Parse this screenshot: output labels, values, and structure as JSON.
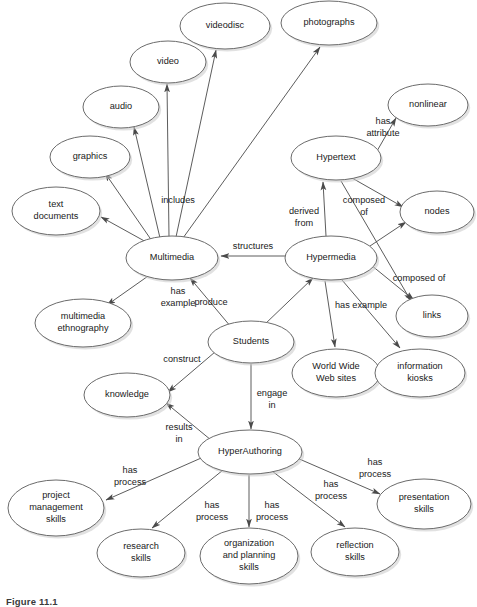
{
  "figure": {
    "caption": "Figure 11.1",
    "width": 477,
    "height": 605,
    "background_color": "#ffffff",
    "node_stroke_color": "#6b6b6b",
    "edge_color": "#4a4a4a",
    "text_color": "#1a1a1a"
  },
  "diagram": {
    "type": "concept-map",
    "nodes": [
      {
        "id": "videodisc",
        "label": "videodisc",
        "lines": [
          "videodisc"
        ],
        "cx": 225,
        "cy": 26,
        "rx": 45,
        "ry": 23
      },
      {
        "id": "photographs",
        "label": "photographs",
        "lines": [
          "photographs"
        ],
        "cx": 329,
        "cy": 23,
        "rx": 48,
        "ry": 22
      },
      {
        "id": "video",
        "label": "video",
        "lines": [
          "video"
        ],
        "cx": 168,
        "cy": 62,
        "rx": 38,
        "ry": 21
      },
      {
        "id": "audio",
        "label": "audio",
        "lines": [
          "audio"
        ],
        "cx": 121,
        "cy": 107,
        "rx": 38,
        "ry": 21
      },
      {
        "id": "nonlinear",
        "label": "nonlinear",
        "lines": [
          "nonlinear"
        ],
        "cx": 428,
        "cy": 105,
        "rx": 40,
        "ry": 21
      },
      {
        "id": "graphics",
        "label": "graphics",
        "lines": [
          "graphics"
        ],
        "cx": 90,
        "cy": 157,
        "rx": 40,
        "ry": 21
      },
      {
        "id": "hypertext",
        "label": "Hypertext",
        "lines": [
          "Hypertext"
        ],
        "cx": 336,
        "cy": 158,
        "rx": 45,
        "ry": 22
      },
      {
        "id": "text-documents",
        "label": "text documents",
        "lines": [
          "text",
          "documents"
        ],
        "cx": 56,
        "cy": 211,
        "rx": 44,
        "ry": 24
      },
      {
        "id": "nodes",
        "label": "nodes",
        "lines": [
          "nodes"
        ],
        "cx": 437,
        "cy": 212,
        "rx": 37,
        "ry": 21
      },
      {
        "id": "multimedia",
        "label": "Multimedia",
        "lines": [
          "Multimedia"
        ],
        "cx": 172,
        "cy": 258,
        "rx": 46,
        "ry": 22
      },
      {
        "id": "hypermedia",
        "label": "Hypermedia",
        "lines": [
          "Hypermedia"
        ],
        "cx": 331,
        "cy": 258,
        "rx": 46,
        "ry": 22
      },
      {
        "id": "links",
        "label": "links",
        "lines": [
          "links"
        ],
        "cx": 432,
        "cy": 316,
        "rx": 36,
        "ry": 21
      },
      {
        "id": "multimedia-ethnography",
        "label": "multimedia ethnography",
        "lines": [
          "multimedia",
          "ethnography"
        ],
        "cx": 83,
        "cy": 323,
        "rx": 48,
        "ry": 24
      },
      {
        "id": "students",
        "label": "Students",
        "lines": [
          "Students"
        ],
        "cx": 251,
        "cy": 342,
        "rx": 43,
        "ry": 21
      },
      {
        "id": "world-wide-web-sites",
        "label": "World Wide Web sites",
        "lines": [
          "World Wide",
          "Web sites"
        ],
        "cx": 336,
        "cy": 373,
        "rx": 44,
        "ry": 24
      },
      {
        "id": "information-kiosks",
        "label": "information kiosks",
        "lines": [
          "information",
          "kiosks"
        ],
        "cx": 420,
        "cy": 373,
        "rx": 45,
        "ry": 24
      },
      {
        "id": "knowledge",
        "label": "knowledge",
        "lines": [
          "knowledge"
        ],
        "cx": 127,
        "cy": 395,
        "rx": 43,
        "ry": 22
      },
      {
        "id": "hyperauthoring",
        "label": "HyperAuthoring",
        "lines": [
          "HyperAuthoring"
        ],
        "cx": 250,
        "cy": 452,
        "rx": 52,
        "ry": 22
      },
      {
        "id": "project-management-skills",
        "label": "project management skills",
        "lines": [
          "project",
          "management",
          "skills"
        ],
        "cx": 56,
        "cy": 508,
        "rx": 48,
        "ry": 28
      },
      {
        "id": "presentation-skills",
        "label": "presentation skills",
        "lines": [
          "presentation",
          "skills"
        ],
        "cx": 424,
        "cy": 504,
        "rx": 47,
        "ry": 25
      },
      {
        "id": "research-skills",
        "label": "research skills",
        "lines": [
          "research",
          "skills"
        ],
        "cx": 141,
        "cy": 553,
        "rx": 44,
        "ry": 24
      },
      {
        "id": "organization-and-planning-skills",
        "label": "organization and planning skills",
        "lines": [
          "organization",
          "and planning",
          "skills"
        ],
        "cx": 249,
        "cy": 556,
        "rx": 49,
        "ry": 28
      },
      {
        "id": "reflection-skills",
        "label": "reflection skills",
        "lines": [
          "reflection",
          "skills"
        ],
        "cx": 355,
        "cy": 552,
        "rx": 44,
        "ry": 24
      }
    ],
    "edges": [
      {
        "id": "multimedia-includes-text-documents",
        "from": "multimedia",
        "to": "text-documents",
        "label": "",
        "x1": 148,
        "y1": 243,
        "x2": 101,
        "y2": 217,
        "lx": 0,
        "ly": 0
      },
      {
        "id": "multimedia-includes-graphics",
        "from": "multimedia",
        "to": "graphics",
        "label": "",
        "x1": 152,
        "y1": 241,
        "x2": 105,
        "y2": 173,
        "lx": 0,
        "ly": 0
      },
      {
        "id": "multimedia-includes-audio",
        "from": "multimedia",
        "to": "audio",
        "label": "includes",
        "x1": 160,
        "y1": 238,
        "x2": 134,
        "y2": 127,
        "lx": 178,
        "ly": 201
      },
      {
        "id": "multimedia-includes-video",
        "from": "multimedia",
        "to": "video",
        "label": "",
        "x1": 169,
        "y1": 237,
        "x2": 167,
        "y2": 84,
        "lx": 0,
        "ly": 0
      },
      {
        "id": "multimedia-includes-videodisc",
        "from": "multimedia",
        "to": "videodisc",
        "label": "",
        "x1": 176,
        "y1": 237,
        "x2": 216,
        "y2": 50,
        "lx": 0,
        "ly": 0
      },
      {
        "id": "multimedia-includes-photographs",
        "from": "multimedia",
        "to": "photographs",
        "label": "",
        "x1": 183,
        "y1": 238,
        "x2": 320,
        "y2": 47,
        "lx": 0,
        "ly": 0
      },
      {
        "id": "hypertext-has-attribute-nonlinear",
        "from": "hypertext",
        "to": "nonlinear",
        "label": "has attribute",
        "x1": 377,
        "y1": 151,
        "x2": 396,
        "y2": 118,
        "lx": 383,
        "ly": 122
      },
      {
        "id": "hypermedia-derived-from-hypertext",
        "from": "hypermedia",
        "to": "hypertext",
        "label": "derived from",
        "x1": 326,
        "y1": 236,
        "x2": 323,
        "y2": 182,
        "lx": 304,
        "ly": 212
      },
      {
        "id": "hypertext-composed-of-links",
        "from": "hypertext",
        "to": "links",
        "label": "composed of",
        "x1": 341,
        "y1": 181,
        "x2": 411,
        "y2": 301,
        "lx": 364,
        "ly": 201
      },
      {
        "id": "hypertext-composed-of-nodes",
        "from": "hypertext",
        "to": "nodes",
        "label": "",
        "x1": 352,
        "y1": 178,
        "x2": 403,
        "y2": 207,
        "lx": 0,
        "ly": 0
      },
      {
        "id": "hypermedia-composed-of-nodes",
        "from": "hypermedia",
        "to": "nodes",
        "label": "composed of",
        "x1": 367,
        "y1": 248,
        "x2": 406,
        "y2": 222,
        "lx": 419,
        "ly": 279
      },
      {
        "id": "hypermedia-composed-of-links",
        "from": "hypermedia",
        "to": "links",
        "label": "",
        "x1": 371,
        "y1": 265,
        "x2": 414,
        "y2": 300,
        "lx": 0,
        "ly": 0
      },
      {
        "id": "hypermedia-structures-multimedia",
        "from": "hypermedia",
        "to": "multimedia",
        "label": "structures",
        "x1": 285,
        "y1": 256,
        "x2": 221,
        "y2": 256,
        "lx": 253,
        "ly": 247
      },
      {
        "id": "multimedia-has-example-ethnography",
        "from": "multimedia",
        "to": "multimedia-ethnography",
        "label": "has example",
        "x1": 151,
        "y1": 274,
        "x2": 107,
        "y2": 305,
        "lx": 178,
        "ly": 292
      },
      {
        "id": "students-produce-multimedia",
        "from": "students",
        "to": "multimedia",
        "label": "produce",
        "x1": 231,
        "y1": 327,
        "x2": 190,
        "y2": 278,
        "lx": 211,
        "ly": 303
      },
      {
        "id": "students-produce-hypermedia",
        "from": "students",
        "to": "hypermedia",
        "label": "",
        "x1": 264,
        "y1": 325,
        "x2": 313,
        "y2": 278,
        "lx": 0,
        "ly": 0
      },
      {
        "id": "hypermedia-has-example-www",
        "from": "hypermedia",
        "to": "world-wide-web-sites",
        "label": "has example",
        "x1": 325,
        "y1": 281,
        "x2": 335,
        "y2": 347,
        "lx": 361,
        "ly": 306
      },
      {
        "id": "hypermedia-has-example-kiosks",
        "from": "hypermedia",
        "to": "information-kiosks",
        "label": "",
        "x1": 342,
        "y1": 280,
        "x2": 400,
        "y2": 348,
        "lx": 0,
        "ly": 0
      },
      {
        "id": "students-construct-knowledge",
        "from": "students",
        "to": "knowledge",
        "label": "construct",
        "x1": 215,
        "y1": 352,
        "x2": 168,
        "y2": 392,
        "lx": 182,
        "ly": 360
      },
      {
        "id": "students-engage-in-hyperauthoring",
        "from": "students",
        "to": "hyperauthoring",
        "label": "engage in",
        "x1": 251,
        "y1": 364,
        "x2": 251,
        "y2": 429,
        "lx": 272,
        "ly": 394
      },
      {
        "id": "hyperauthoring-results-in-knowledge",
        "from": "hyperauthoring",
        "to": "knowledge",
        "label": "results in",
        "x1": 211,
        "y1": 440,
        "x2": 166,
        "y2": 403,
        "lx": 179,
        "ly": 428
      },
      {
        "id": "hyperauthoring-has-process-project",
        "from": "hyperauthoring",
        "to": "project-management-skills",
        "label": "has process",
        "x1": 208,
        "y1": 455,
        "x2": 106,
        "y2": 500,
        "lx": 130,
        "ly": 471
      },
      {
        "id": "hyperauthoring-has-process-research",
        "from": "hyperauthoring",
        "to": "research-skills",
        "label": "has process",
        "x1": 223,
        "y1": 470,
        "x2": 152,
        "y2": 528,
        "lx": 212,
        "ly": 506
      },
      {
        "id": "hyperauthoring-has-process-organization",
        "from": "hyperauthoring",
        "to": "organization-and-planning-skills",
        "label": "has process",
        "x1": 249,
        "y1": 475,
        "x2": 249,
        "y2": 527,
        "lx": 272,
        "ly": 506
      },
      {
        "id": "hyperauthoring-has-process-reflection",
        "from": "hyperauthoring",
        "to": "reflection-skills",
        "label": "has process",
        "x1": 272,
        "y1": 471,
        "x2": 345,
        "y2": 527,
        "lx": 331,
        "ly": 485
      },
      {
        "id": "hyperauthoring-has-process-presentation",
        "from": "hyperauthoring",
        "to": "presentation-skills",
        "label": "has process",
        "x1": 297,
        "y1": 458,
        "x2": 380,
        "y2": 494,
        "lx": 375,
        "ly": 463
      }
    ]
  }
}
